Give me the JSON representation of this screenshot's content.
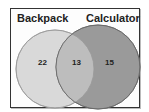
{
  "diagram": {
    "type": "venn",
    "sets": [
      {
        "label": "Backpack",
        "only_count": "22",
        "fill": "#d9d9d9"
      },
      {
        "label": "Calculator",
        "only_count": "15",
        "fill": "#9a9a9a"
      }
    ],
    "intersection_count": "13",
    "intersection_fill": "#bdbdbd"
  }
}
